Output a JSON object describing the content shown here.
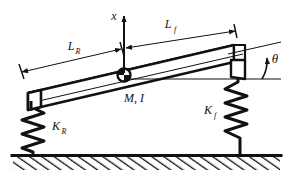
{
  "figure": {
    "background_color": "#ffffff",
    "line_color": "#111111",
    "canvas": {
      "width": 289,
      "height": 186
    }
  },
  "labels": {
    "vertical_displacement": {
      "symbol": "x",
      "sub": ""
    },
    "front_length": {
      "symbol": "L",
      "sub": "f"
    },
    "rear_length": {
      "symbol": "L",
      "sub": "R"
    },
    "pitch_angle": {
      "symbol": "θ",
      "sub": ""
    },
    "body_properties": {
      "symbol": "M, I",
      "sub": ""
    },
    "rear_stiffness": {
      "symbol": "K",
      "sub": "R"
    },
    "front_stiffness": {
      "symbol": "K",
      "sub": "f"
    }
  },
  "components": {
    "beam": {
      "name": "rigid-body-beam",
      "mass_symbol": "M",
      "inertia_symbol": "I"
    },
    "rear_spring": {
      "name": "rear-spring",
      "stiffness_symbol": "K_R",
      "coils": 5
    },
    "front_spring": {
      "name": "front-spring",
      "stiffness_symbol": "K_f",
      "coils": 5
    },
    "ground": {
      "name": "hatched-ground",
      "hatch_angle_deg": 55
    },
    "cg_marker": {
      "name": "center-of-gravity-marker"
    }
  },
  "dimensions": {
    "rear_arm_label": "L_R",
    "front_arm_label": "L_f",
    "angle_label": "θ",
    "axis_label": "x"
  }
}
